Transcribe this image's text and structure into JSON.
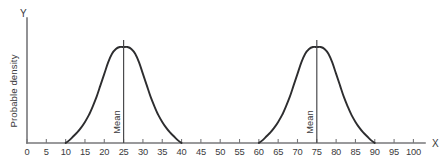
{
  "chart_data": {
    "type": "line",
    "title": "",
    "subtitle": "",
    "xlabel": "X",
    "ylabel": "Probable density",
    "xlim": [
      0,
      103
    ],
    "ylim": [
      0,
      1.12
    ],
    "grid": false,
    "legend": null,
    "x_ticks": [
      0,
      5,
      10,
      15,
      20,
      25,
      30,
      35,
      40,
      45,
      50,
      55,
      60,
      65,
      70,
      75,
      80,
      85,
      90,
      95,
      100
    ],
    "x_tick_labels": [
      "0",
      "5",
      "10",
      "15",
      "20",
      "25",
      "30",
      "35",
      "40",
      "45",
      "50",
      "55",
      "60",
      "65",
      "70",
      "75",
      "80",
      "85",
      "90",
      "95",
      "100"
    ],
    "y_ticks": [],
    "y_tick_labels": [],
    "annotations": [
      {
        "text": "Mean",
        "x": 25,
        "orientation": "vertical"
      },
      {
        "text": "Mean",
        "x": 75,
        "orientation": "vertical"
      }
    ],
    "series": [
      {
        "name": "distribution-left",
        "mean": 25,
        "x_start": 10,
        "x_end": 40,
        "peak": 1.0,
        "points_x": [
          10,
          11,
          12,
          13,
          14,
          15,
          16,
          17,
          18,
          19,
          20,
          21,
          22,
          23,
          24,
          25,
          26,
          27,
          28,
          29,
          30,
          31,
          32,
          33,
          34,
          35,
          36,
          37,
          38,
          39,
          40
        ],
        "points_y": [
          0.0,
          0.03,
          0.07,
          0.11,
          0.16,
          0.22,
          0.29,
          0.38,
          0.48,
          0.6,
          0.72,
          0.84,
          0.93,
          0.98,
          1.0,
          1.0,
          1.0,
          0.98,
          0.93,
          0.84,
          0.72,
          0.6,
          0.48,
          0.38,
          0.29,
          0.22,
          0.16,
          0.11,
          0.07,
          0.03,
          0.0
        ]
      },
      {
        "name": "distribution-right",
        "mean": 75,
        "x_start": 60,
        "x_end": 90,
        "peak": 1.0,
        "points_x": [
          60,
          61,
          62,
          63,
          64,
          65,
          66,
          67,
          68,
          69,
          70,
          71,
          72,
          73,
          74,
          75,
          76,
          77,
          78,
          79,
          80,
          81,
          82,
          83,
          84,
          85,
          86,
          87,
          88,
          89,
          90
        ],
        "points_y": [
          0.0,
          0.03,
          0.07,
          0.11,
          0.16,
          0.22,
          0.29,
          0.38,
          0.48,
          0.6,
          0.72,
          0.84,
          0.93,
          0.98,
          1.0,
          1.0,
          1.0,
          0.98,
          0.93,
          0.84,
          0.72,
          0.6,
          0.48,
          0.38,
          0.29,
          0.22,
          0.16,
          0.11,
          0.07,
          0.03,
          0.0
        ]
      }
    ],
    "colors": {
      "curve": "#2d2d2f",
      "axis": "#77777a",
      "mean_line": "#4a4a4d",
      "text": "#3a3a3c",
      "background": "#ffffff"
    }
  },
  "axes": {
    "y_axis_name": "Y",
    "x_axis_name": "X",
    "y_axis_label": "Probable density"
  },
  "labels": {
    "mean_left": "Mean",
    "mean_right": "Mean"
  }
}
